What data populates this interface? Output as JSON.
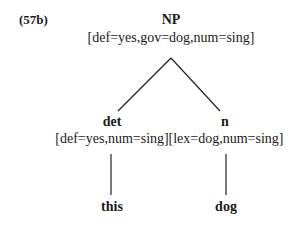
{
  "example_number": "(57b)",
  "tree": {
    "root": {
      "label": "NP",
      "features": "[def=yes,gov=dog,num=sing]"
    },
    "children": [
      {
        "label": "det",
        "features": "[def=yes,num=sing]",
        "word": "this"
      },
      {
        "label": "n",
        "features": "[lex=dog,num=sing]",
        "word": "dog"
      }
    ]
  }
}
